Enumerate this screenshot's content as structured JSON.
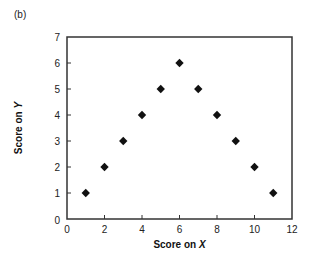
{
  "panel_label": "(b)",
  "chart_data": {
    "type": "scatter",
    "title": "",
    "panel": "(b)",
    "xlabel": "Score on X",
    "xlabel_prefix": "Score on ",
    "xlabel_var": "X",
    "ylabel": "Score on Y",
    "ylabel_prefix": "Score on ",
    "ylabel_var": "Y",
    "xlim": [
      0,
      12
    ],
    "ylim": [
      0,
      7
    ],
    "xticks": [
      0,
      2,
      4,
      6,
      8,
      10,
      12
    ],
    "yticks": [
      0,
      1,
      2,
      3,
      4,
      5,
      6,
      7
    ],
    "grid": false,
    "legend": null,
    "marker": "diamond",
    "marker_color": "#111111",
    "series": [
      {
        "name": "scores",
        "x": [
          1,
          2,
          3,
          4,
          5,
          6,
          7,
          8,
          9,
          10,
          11
        ],
        "y": [
          1,
          2,
          3,
          4,
          5,
          6,
          5,
          4,
          3,
          2,
          1
        ]
      }
    ]
  }
}
